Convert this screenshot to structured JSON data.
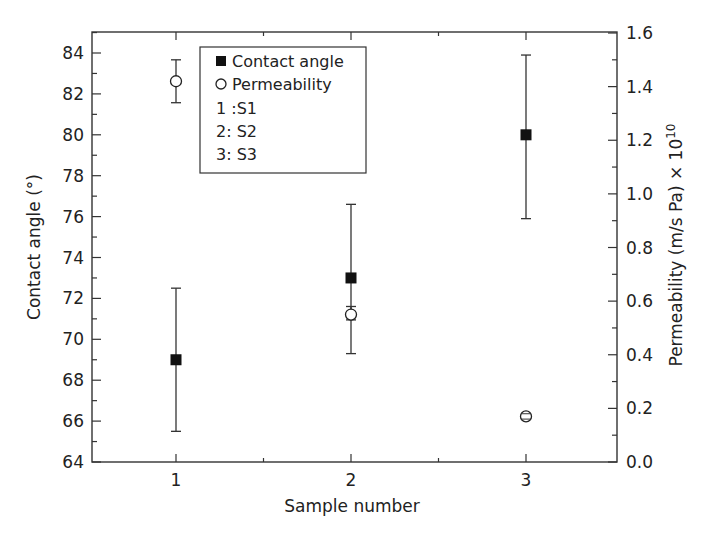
{
  "chart_data": {
    "type": "scatter",
    "title": "",
    "xlabel": "Sample number",
    "ylabel": "Contact angle (°)",
    "ylabel_right": "Permeability (m/s Pa) × 10^10",
    "ylabel_right_base": "Permeability (m/s Pa) × 10",
    "ylabel_right_exp": "10",
    "x": [
      1,
      2,
      3
    ],
    "x_ticks": [
      "1",
      "2",
      "3"
    ],
    "xlim": [
      0.52,
      3.52
    ],
    "ylim": [
      64,
      85
    ],
    "ylim_right": [
      0.0,
      1.6
    ],
    "y_ticks": [
      "64",
      "66",
      "68",
      "70",
      "72",
      "74",
      "76",
      "78",
      "80",
      "82",
      "84"
    ],
    "y_ticks_right": [
      "0.0",
      "0.2",
      "0.4",
      "0.6",
      "0.8",
      "1.0",
      "1.2",
      "1.4",
      "1.6"
    ],
    "grid": false,
    "legend_position": "upper-left-inside",
    "series": [
      {
        "name": "Contact angle",
        "axis": "left",
        "marker": "filled-square",
        "values": [
          69.0,
          73.0,
          80.0
        ],
        "err_low": [
          65.5,
          69.3,
          75.9
        ],
        "err_high": [
          72.5,
          76.6,
          83.9
        ]
      },
      {
        "name": "Permeability",
        "axis": "right",
        "marker": "open-circle",
        "values": [
          1.42,
          0.55,
          0.17
        ],
        "err_low": [
          1.34,
          0.53,
          0.16
        ],
        "err_high": [
          1.5,
          0.58,
          0.18
        ]
      }
    ],
    "legend": {
      "entries": [
        "Contact angle",
        "Permeability"
      ],
      "annotations": [
        "1 :S1",
        "2: S2",
        "3: S3"
      ]
    }
  }
}
